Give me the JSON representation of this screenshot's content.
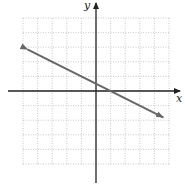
{
  "chart_data": {
    "type": "line",
    "title": "",
    "xlabel": "x",
    "ylabel": "y",
    "grid": true,
    "grid_style": "dotted",
    "xlim": [
      -5,
      5
    ],
    "ylim": [
      -5,
      5
    ],
    "tick_labels_shown": false,
    "series": [
      {
        "name": "line",
        "equation": "y = -0.5x + 0.5",
        "x": [
          -4.7,
          4.6
        ],
        "y": [
          2.85,
          -1.8
        ],
        "arrows": "both",
        "color": "#666666"
      }
    ]
  },
  "labels": {
    "x_axis": "x",
    "y_axis": "y"
  },
  "colors": {
    "axis": "#222222",
    "grid": "#bbbbbb",
    "line": "#666666"
  }
}
